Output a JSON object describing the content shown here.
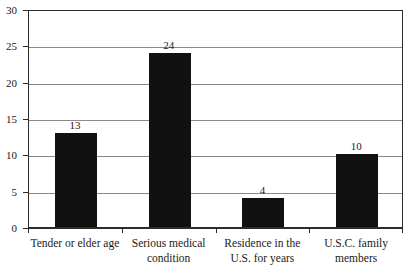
{
  "chart_data": {
    "type": "bar",
    "title": "",
    "subtitle": "",
    "xlabel": "",
    "ylabel": "",
    "categories": [
      "Tender or elder age",
      "Serious medical condition",
      "Residence in the U.S. for years",
      "U.S.C. family members"
    ],
    "values": [
      13,
      24,
      4,
      10
    ],
    "value_labels": [
      "13",
      "24",
      "4",
      "10"
    ],
    "ylim": [
      0,
      30
    ],
    "ytick_labels": [
      "0",
      "5",
      "10",
      "15",
      "20",
      "25",
      "30"
    ],
    "yticks": [
      0,
      5,
      10,
      15,
      20,
      25,
      30
    ],
    "grid": true,
    "grid_axis": "y",
    "legend": false,
    "legend_position": "none",
    "bar_color": "#111111",
    "grid_color": "#8a8a8a",
    "axis_color": "#2b2b2b",
    "background_color": "#ffffff"
  }
}
